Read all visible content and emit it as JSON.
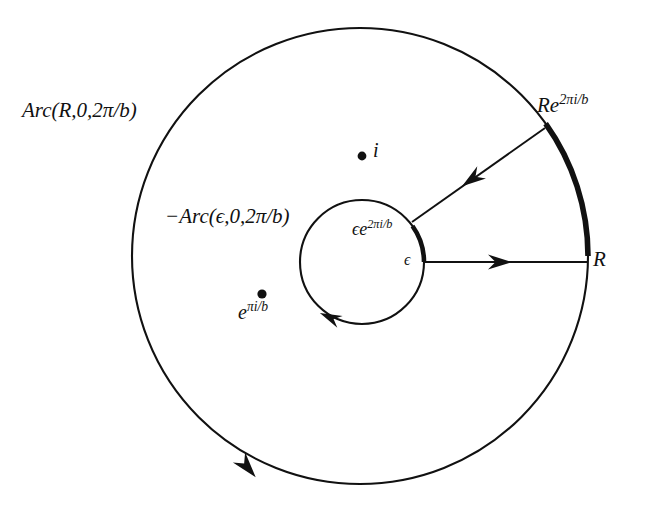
{
  "figure": {
    "type": "complex-analysis-contour-diagram",
    "background_color": "#ffffff",
    "stroke_color": "#111111"
  },
  "geometry": {
    "outer_circle": {
      "cx": 360,
      "cy": 256,
      "r": 228
    },
    "inner_circle": {
      "cx": 362,
      "cy": 262,
      "r": 62
    },
    "sector_angle_degrees": 35.5,
    "thick_arc_start_degrees": 0,
    "thick_arc_end_degrees": 35.5,
    "radial_ray_outward": {
      "x1": 424,
      "y1": 262,
      "x2": 588,
      "y2": 262
    },
    "radial_ray_inward": {
      "x1": 545,
      "y1": 128,
      "x2": 412,
      "y2": 222
    }
  },
  "labels": {
    "outer_arc": {
      "text": "Arc(R,0,2π/b)",
      "x": 22,
      "y": 100
    },
    "inner_arc": {
      "text": "−Arc(ϵ,0,2π/b)",
      "x": 165,
      "y": 206
    },
    "outer_endpoint": {
      "base": "Re",
      "exponent": "2πi/b",
      "x": 537,
      "y": 92
    },
    "outer_radius": {
      "text": "R",
      "x": 593,
      "y": 249
    },
    "inner_endpoint": {
      "base": "ϵe",
      "exponent": "2πi/b",
      "x": 352,
      "y": 218
    },
    "inner_radius": {
      "text": "ϵ",
      "x": 404,
      "y": 252
    },
    "pole_i": {
      "text": "i",
      "x": 373,
      "y": 140
    },
    "pole_e": {
      "base": "e",
      "exponent": "πi/b",
      "x": 238,
      "y": 300
    }
  },
  "points": [
    {
      "name": "pole-i",
      "x": 362,
      "y": 156,
      "label": "i"
    },
    {
      "name": "pole-e-pi-i-over-b",
      "x": 262,
      "y": 294,
      "label": "e^{πi/b}"
    }
  ],
  "arrows": [
    {
      "name": "outer-circle-arrow",
      "x": 245,
      "y": 466,
      "direction": "counterclockwise-along-outer-circle"
    },
    {
      "name": "inner-circle-arrow",
      "x": 331,
      "y": 318,
      "direction": "clockwise-along-inner-circle"
    },
    {
      "name": "outward-ray-arrow",
      "x": 505,
      "y": 262,
      "direction": "right"
    },
    {
      "name": "inward-ray-arrow",
      "x": 477,
      "y": 176,
      "direction": "down-left"
    }
  ]
}
